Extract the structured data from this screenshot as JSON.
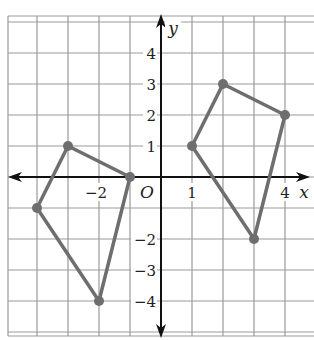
{
  "diagram": {
    "type": "coordinate-plane",
    "grid": {
      "x_range": [
        -5,
        4
      ],
      "y_range": [
        -5,
        5
      ],
      "cell_px": 31,
      "origin_px": [
        161,
        177
      ],
      "grid_color": "#9a9a9a",
      "axis_color": "#111111"
    },
    "axes": {
      "x_label": "x",
      "y_label": "y",
      "origin_label": "O",
      "x_ticks": [
        {
          "value": -2,
          "label": "−2"
        },
        {
          "value": 1,
          "label": "1"
        },
        {
          "value": 4,
          "label": "4"
        }
      ],
      "y_ticks": [
        {
          "value": 4,
          "label": "4"
        },
        {
          "value": 3,
          "label": "3"
        },
        {
          "value": 2,
          "label": "2"
        },
        {
          "value": 1,
          "label": "1"
        },
        {
          "value": -2,
          "label": "−2"
        },
        {
          "value": -3,
          "label": "−3"
        },
        {
          "value": -4,
          "label": "−4"
        }
      ]
    },
    "shapes": [
      {
        "name": "left-quadrilateral",
        "color": "#6e6e6e",
        "vertices": [
          [
            -3,
            1
          ],
          [
            -1,
            0
          ],
          [
            -2,
            -4
          ],
          [
            -4,
            -1
          ]
        ]
      },
      {
        "name": "right-quadrilateral",
        "color": "#6e6e6e",
        "vertices": [
          [
            1,
            1
          ],
          [
            2,
            3
          ],
          [
            4,
            2
          ],
          [
            3,
            -2
          ]
        ]
      }
    ]
  }
}
